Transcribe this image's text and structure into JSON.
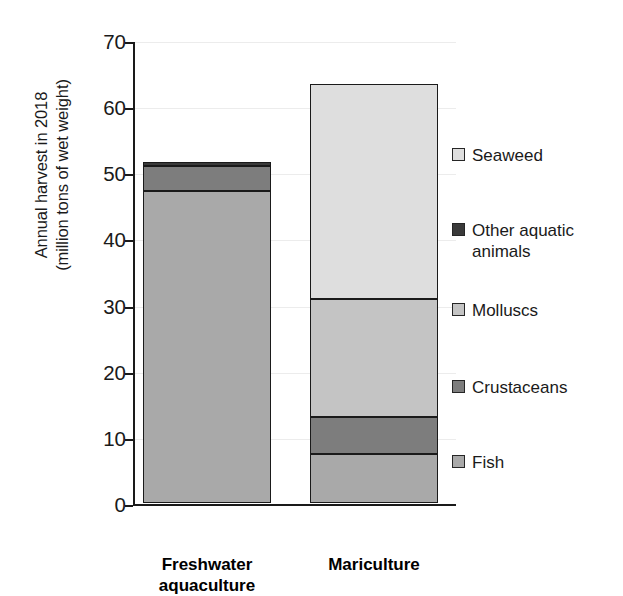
{
  "chart_data": {
    "type": "bar",
    "subtype": "stacked-bar",
    "title": "",
    "xlabel": "",
    "ylabel": "Annual harvest in 2018\n(million tons of wet weight)",
    "ylim": [
      0,
      70
    ],
    "yticks": [
      0,
      10,
      20,
      30,
      40,
      50,
      60,
      70
    ],
    "ytick_labels": [
      "0",
      "10",
      "20",
      "30",
      "40",
      "50",
      "60",
      "70"
    ],
    "grid": true,
    "grid_axis": "y",
    "legend_position": "right",
    "categories": [
      "Freshwater\naquaculture",
      "Mariculture"
    ],
    "category_labels_plain": [
      "Freshwater aquaculture",
      "Mariculture"
    ],
    "series": [
      {
        "name": "Fish",
        "values": [
          47.1,
          7.4
        ],
        "color": "#a9a9a9"
      },
      {
        "name": "Crustaceans",
        "values": [
          3.8,
          5.6
        ],
        "color": "#7d7d7d"
      },
      {
        "name": "Molluscs",
        "values": [
          0.0,
          17.8
        ],
        "color": "#c4c4c4"
      },
      {
        "name": "Other aquatic\nanimals",
        "values": [
          0.6,
          0.0
        ],
        "color": "#3a3a3a"
      },
      {
        "name": "Seaweed",
        "values": [
          0.0,
          32.5
        ],
        "color": "#dedede"
      }
    ],
    "stack_order_bottom_to_top": [
      "Fish",
      "Crustaceans",
      "Molluscs",
      "Other aquatic animals",
      "Seaweed"
    ],
    "totals": [
      51.5,
      63.3
    ],
    "legend_order_top_to_bottom": [
      "Seaweed",
      "Other aquatic animals",
      "Molluscs",
      "Crustaceans",
      "Fish"
    ]
  },
  "legend": {
    "items": [
      {
        "label": "Seaweed",
        "color": "#dedede"
      },
      {
        "label": "Other aquatic\nanimals",
        "color": "#3a3a3a"
      },
      {
        "label": "Molluscs",
        "color": "#c4c4c4"
      },
      {
        "label": "Crustaceans",
        "color": "#7d7d7d"
      },
      {
        "label": "Fish",
        "color": "#a9a9a9"
      }
    ]
  },
  "axis": {
    "y_title": "Annual harvest in 2018\n(million tons of wet weight)",
    "y_ticks": [
      "70",
      "60",
      "50",
      "40",
      "30",
      "20",
      "10",
      "0"
    ]
  },
  "colors": {
    "axis": "#1a1a1a",
    "grid": "#ececec",
    "background": "#ffffff",
    "outline": "#1a1a1a"
  }
}
